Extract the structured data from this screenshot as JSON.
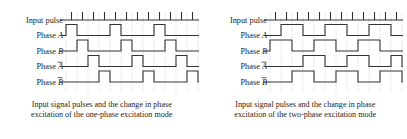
{
  "figure": {
    "panels": [
      {
        "id": "one-phase",
        "mode": "one-phase",
        "caption_line1": "Input signal pulses and the change in phase",
        "caption_line2": "excitation of the one-phase excitation mode",
        "rows": [
          {
            "label_prefix": "Input pulse",
            "label_symbol": "",
            "overbar": false,
            "kind": "ticks"
          },
          {
            "label_prefix": "Phase ",
            "label_symbol": "A",
            "overbar": false,
            "kind": "wave"
          },
          {
            "label_prefix": "Phase ",
            "label_symbol": "B",
            "overbar": false,
            "kind": "wave"
          },
          {
            "label_prefix": "Phase ",
            "label_symbol": "A",
            "overbar": true,
            "kind": "wave"
          },
          {
            "label_prefix": "Phase ",
            "label_symbol": "B",
            "overbar": true,
            "kind": "wave"
          }
        ]
      },
      {
        "id": "two-phase",
        "mode": "two-phase",
        "caption_line1": "Input signal pulses and the change in phase",
        "caption_line2": "excitation of the two-phase excitation mode",
        "rows": [
          {
            "label_prefix": "Input pulse",
            "label_symbol": "",
            "overbar": false,
            "kind": "ticks"
          },
          {
            "label_prefix": "Phase ",
            "label_symbol": "A",
            "overbar": false,
            "kind": "wave"
          },
          {
            "label_prefix": "Phase ",
            "label_symbol": "B",
            "overbar": false,
            "kind": "wave"
          },
          {
            "label_prefix": "Phase ",
            "label_symbol": "A",
            "overbar": true,
            "kind": "wave"
          },
          {
            "label_prefix": "Phase ",
            "label_symbol": "B",
            "overbar": true,
            "kind": "wave"
          }
        ]
      }
    ]
  },
  "chart_data": {
    "type": "line",
    "xlabel": "",
    "ylabel": "",
    "grid": true,
    "legend": "none",
    "x_ticks": 12,
    "x_unit": "input pulse step",
    "signal_levels": [
      0,
      1
    ],
    "charts": [
      {
        "name": "one-phase excitation mode",
        "caption": "Input signal pulses and the change in phase excitation of the one-phase excitation mode",
        "pulse_width_steps": 1,
        "period_steps": 4,
        "n_steps": 12,
        "series": [
          {
            "name": "Input pulse",
            "type": "tick-train",
            "tick_positions": [
              0,
              1,
              2,
              3,
              4,
              5,
              6,
              7,
              8,
              9,
              10,
              11
            ]
          },
          {
            "name": "Phase A",
            "type": "square",
            "offset_steps": 0,
            "high_intervals": [
              [
                0,
                1
              ],
              [
                4,
                5
              ],
              [
                8,
                9
              ]
            ],
            "values": [
              1,
              0,
              0,
              0,
              1,
              0,
              0,
              0,
              1,
              0,
              0,
              0
            ]
          },
          {
            "name": "Phase B",
            "type": "square",
            "offset_steps": 1,
            "high_intervals": [
              [
                1,
                2
              ],
              [
                5,
                6
              ],
              [
                9,
                10
              ]
            ],
            "values": [
              0,
              1,
              0,
              0,
              0,
              1,
              0,
              0,
              0,
              1,
              0,
              0
            ]
          },
          {
            "name": "Phase A-bar",
            "type": "square",
            "offset_steps": 2,
            "high_intervals": [
              [
                2,
                3
              ],
              [
                6,
                7
              ],
              [
                10,
                11
              ]
            ],
            "values": [
              0,
              0,
              1,
              0,
              0,
              0,
              1,
              0,
              0,
              0,
              1,
              0
            ]
          },
          {
            "name": "Phase B-bar",
            "type": "square",
            "offset_steps": 3,
            "high_intervals": [
              [
                3,
                4
              ],
              [
                7,
                8
              ],
              [
                11,
                12
              ]
            ],
            "values": [
              0,
              0,
              0,
              1,
              0,
              0,
              0,
              1,
              0,
              0,
              0,
              1
            ]
          }
        ]
      },
      {
        "name": "two-phase excitation mode",
        "caption": "Input signal pulses and the change in phase excitation of the two-phase excitation mode",
        "pulse_width_steps": 2,
        "period_steps": 4,
        "n_steps": 12,
        "series": [
          {
            "name": "Input pulse",
            "type": "tick-train",
            "tick_positions": [
              0,
              1,
              2,
              3,
              4,
              5,
              6,
              7,
              8,
              9,
              10,
              11
            ]
          },
          {
            "name": "Phase A",
            "type": "square",
            "offset_steps": 1,
            "high_intervals": [
              [
                1,
                3
              ],
              [
                5,
                7
              ],
              [
                9,
                11
              ]
            ],
            "values": [
              0,
              1,
              1,
              0,
              0,
              1,
              1,
              0,
              0,
              1,
              1,
              0
            ]
          },
          {
            "name": "Phase B",
            "type": "square",
            "offset_steps": 0,
            "high_intervals": [
              [
                0,
                2
              ],
              [
                4,
                6
              ],
              [
                8,
                10
              ]
            ],
            "values": [
              1,
              1,
              0,
              0,
              1,
              1,
              0,
              0,
              1,
              1,
              0,
              0
            ]
          },
          {
            "name": "Phase A-bar",
            "type": "square",
            "offset_steps": 3,
            "high_intervals": [
              [
                3,
                5
              ],
              [
                7,
                9
              ],
              [
                11,
                12
              ]
            ],
            "values": [
              0,
              0,
              0,
              1,
              1,
              0,
              0,
              1,
              1,
              0,
              0,
              1
            ]
          },
          {
            "name": "Phase B-bar",
            "type": "square",
            "offset_steps": 2,
            "high_intervals": [
              [
                2,
                4
              ],
              [
                6,
                8
              ],
              [
                10,
                12
              ]
            ],
            "values": [
              0,
              0,
              1,
              1,
              0,
              0,
              1,
              1,
              0,
              0,
              1,
              1
            ]
          }
        ]
      }
    ]
  },
  "style": {
    "signal_color": "#333333",
    "gridline_color": "#bbbbbb",
    "text_color": "#1d1d1d",
    "background": "#ffffff"
  }
}
